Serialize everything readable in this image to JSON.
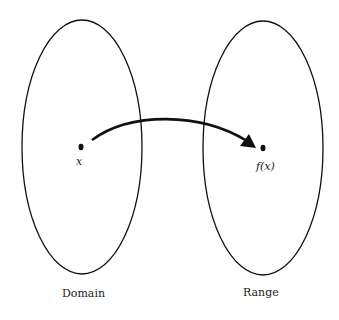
{
  "diagram": {
    "domain_label": "Domain",
    "range_label": "Range",
    "element_label": "x",
    "image_label": "f(x)",
    "stroke_color": "#111111"
  }
}
